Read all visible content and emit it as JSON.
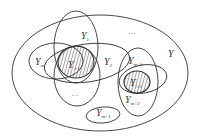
{
  "diagram": {
    "type": "venn-set-diagram",
    "universe": {
      "label": "Y",
      "sub": ""
    },
    "sets": [
      {
        "id": "y1",
        "label": "Y",
        "sub": "1"
      },
      {
        "id": "ym",
        "label": "Y",
        "sub": "m"
      },
      {
        "id": "y2",
        "label": "Y",
        "sub": "2"
      },
      {
        "id": "ymk",
        "label": "Y",
        "sub": "m+k"
      },
      {
        "id": "ym2",
        "label": "Y",
        "sub": "m+2"
      },
      {
        "id": "ym1",
        "label": "Y",
        "sub": "m+1"
      }
    ],
    "intersections": [
      {
        "id": "cap1",
        "label": "Y",
        "sub": "∩1",
        "shaded": true
      },
      {
        "id": "cap2",
        "label": "Y",
        "sub": "∩2",
        "shaded": true
      }
    ],
    "ellipsis": {
      "top": "…",
      "middle": "…"
    },
    "colors": {
      "stroke": "#333333",
      "hatch": "#333333",
      "background": "#ffffff"
    }
  }
}
